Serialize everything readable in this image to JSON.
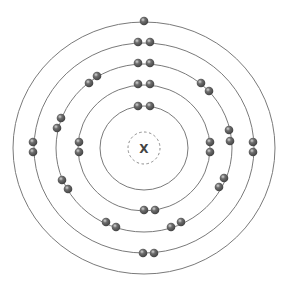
{
  "diagram": {
    "type": "bohr-model",
    "nucleus": {
      "label": "X",
      "center": [
        144,
        148
      ],
      "radius": 16
    },
    "colors": {
      "shell_line": "#7a7a7a",
      "nucleus_dash": "#8a8a8a",
      "electron_dark": "#3e3e3e",
      "electron_mid": "#6e6e6e",
      "electron_light": "#d8d8d8",
      "label": "#444444"
    },
    "shells": [
      {
        "name": "shell-1",
        "rx": 44,
        "ry": 42,
        "electron_count": 2,
        "electrons": [
          [
            138,
            106
          ],
          [
            150,
            106
          ]
        ]
      },
      {
        "name": "shell-2",
        "rx": 66,
        "ry": 63,
        "electron_count": 8,
        "electrons": [
          [
            138,
            84
          ],
          [
            150,
            84
          ],
          [
            79,
            142
          ],
          [
            79,
            152
          ],
          [
            210,
            142
          ],
          [
            210,
            152
          ],
          [
            144,
            210
          ],
          [
            155,
            210
          ]
        ]
      },
      {
        "name": "shell-3",
        "rx": 88,
        "ry": 84,
        "electron_count": 18,
        "electrons": [
          [
            138,
            63
          ],
          [
            150,
            63
          ],
          [
            89,
            83
          ],
          [
            97,
            76
          ],
          [
            201,
            83
          ],
          [
            209,
            91
          ],
          [
            61,
            118
          ],
          [
            57,
            128
          ],
          [
            229,
            130
          ],
          [
            230,
            141
          ],
          [
            62,
            180
          ],
          [
            68,
            189
          ],
          [
            224,
            178
          ],
          [
            219,
            187
          ],
          [
            106,
            222
          ],
          [
            116,
            227
          ],
          [
            171,
            227
          ],
          [
            181,
            222
          ]
        ]
      },
      {
        "name": "shell-4",
        "rx": 110,
        "ry": 105,
        "electron_count": 8,
        "electrons": [
          [
            138,
            42
          ],
          [
            150,
            42
          ],
          [
            33,
            142
          ],
          [
            33,
            152
          ],
          [
            253,
            142
          ],
          [
            253,
            152
          ],
          [
            143,
            253
          ],
          [
            154,
            253
          ]
        ]
      },
      {
        "name": "shell-5",
        "rx": 131,
        "ry": 126,
        "electron_count": 1,
        "electrons": [
          [
            144,
            21
          ]
        ]
      }
    ]
  }
}
